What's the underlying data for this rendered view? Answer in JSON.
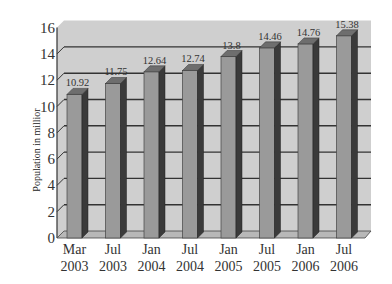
{
  "chart_data": {
    "type": "bar",
    "title": "",
    "xlabel": "",
    "ylabel": "Population in millior",
    "ylim": [
      0,
      16
    ],
    "yticks": [
      0,
      2,
      4,
      6,
      8,
      10,
      12,
      14,
      16
    ],
    "grid": true,
    "legend": null,
    "style": "3d-column",
    "categories": [
      [
        "Mar",
        "2003"
      ],
      [
        "Jul",
        "2003"
      ],
      [
        "Jan",
        "2004"
      ],
      [
        "Jul",
        "2004"
      ],
      [
        "Jan",
        "2005"
      ],
      [
        "Jul",
        "2005"
      ],
      [
        "Jan",
        "2006"
      ],
      [
        "Jul",
        "2006"
      ]
    ],
    "values": [
      10.92,
      11.75,
      12.64,
      12.74,
      13.8,
      14.46,
      14.76,
      15.38
    ],
    "value_labels": [
      "10.92",
      "11.75",
      "12.64",
      "12.74",
      "13.8",
      "14.46",
      "14.76",
      "15.38"
    ],
    "colors": {
      "bar_front": "#9a9a9a",
      "bar_side": "#3a3a3a",
      "bar_top": "#6e6e6e",
      "wall": "#cfcfcf",
      "gridline": "#333333",
      "floor": "#b8b8b8"
    }
  }
}
